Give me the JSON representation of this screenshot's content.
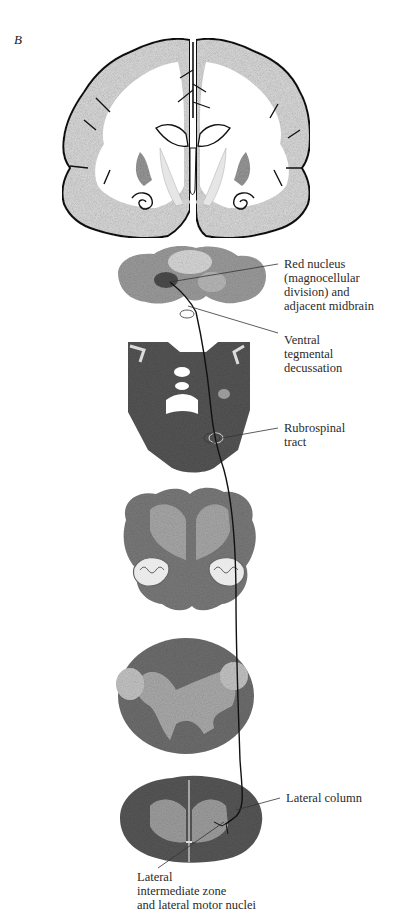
{
  "figure": {
    "panel_label": "B",
    "sections": [
      {
        "id": "coronal-forebrain",
        "kind": "line drawing"
      },
      {
        "id": "midbrain",
        "kind": "stained section"
      },
      {
        "id": "pons",
        "kind": "stained section"
      },
      {
        "id": "medulla",
        "kind": "stained section"
      },
      {
        "id": "cervical-cord",
        "kind": "stained section"
      },
      {
        "id": "lumbar-cord",
        "kind": "stained section"
      }
    ],
    "labels": {
      "red_nucleus": [
        "Red nucleus",
        "(magnocellular",
        "division) and",
        "adjacent midbrain"
      ],
      "ventral_tegmental": [
        "Ventral",
        "tegmental",
        "decussation"
      ],
      "rubrospinal": [
        "Rubrospinal",
        "tract"
      ],
      "lateral_column": [
        "Lateral column"
      ],
      "lateral_intermediate": [
        "Lateral",
        "intermediate zone",
        "and lateral motor nuclei"
      ]
    },
    "colors": {
      "cortex_fill": "#d9d9d9",
      "outline": "#111111",
      "section_dark": "#5a5a5a",
      "section_mid": "#8a8a8a",
      "section_light": "#c8c8c8",
      "leader": "#333333"
    }
  }
}
